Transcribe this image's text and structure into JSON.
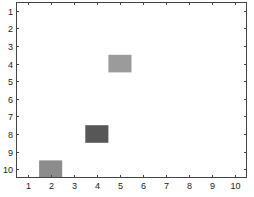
{
  "chart_data": {
    "type": "heatmap",
    "title": "",
    "xlabel": "",
    "ylabel": "",
    "xlim": [
      0.5,
      10.5
    ],
    "ylim": [
      0.5,
      10.5
    ],
    "y_reversed": true,
    "grid": false,
    "legend": null,
    "x_ticks": [
      1,
      2,
      3,
      4,
      5,
      6,
      7,
      8,
      9,
      10
    ],
    "y_ticks": [
      1,
      2,
      3,
      4,
      5,
      6,
      7,
      8,
      9,
      10
    ],
    "background": "#ffffff",
    "cells": [
      {
        "x": 5,
        "y": 4,
        "color": "#9b9b9b"
      },
      {
        "x": 4,
        "y": 8,
        "color": "#575757"
      },
      {
        "x": 2,
        "y": 10,
        "color": "#8c8c8c"
      }
    ]
  },
  "layout": {
    "plot_left": 16,
    "plot_right": 247,
    "plot_top": 2,
    "plot_bottom": 178,
    "axis_color": "#444444"
  }
}
